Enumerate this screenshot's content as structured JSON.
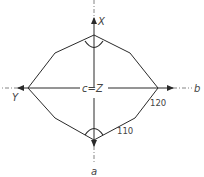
{
  "diagram": {
    "type": "crystal-section-stereogram",
    "axes": {
      "top": "X",
      "left": "Y",
      "right": "b",
      "bottom": "a",
      "center": "c=Z"
    },
    "face_labels": {
      "face_120": "120",
      "face_110": "110"
    },
    "colors": {
      "line": "#2a2a2a",
      "text": "#444444",
      "background": "#ffffff"
    }
  }
}
